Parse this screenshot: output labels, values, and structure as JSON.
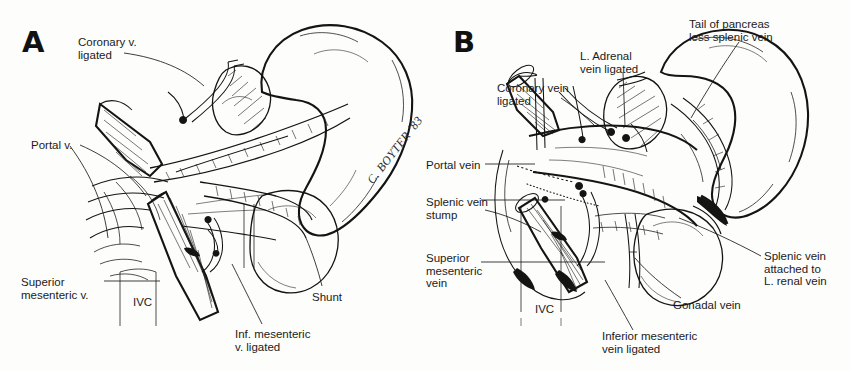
{
  "figure": {
    "background_color": "#fdfdfb",
    "ink_color": "#141414",
    "width": 850,
    "height": 371
  },
  "panel_a": {
    "letter": "A",
    "signature": "C. BOYTER '83",
    "labels": [
      {
        "id": "coronary-vein-ligated",
        "text": "Coronary v.\nligated",
        "x": 78,
        "y": 36,
        "align": "left"
      },
      {
        "id": "portal-vein",
        "text": "Portal v.",
        "x": 31,
        "y": 139,
        "align": "left"
      },
      {
        "id": "superior-mesenteric-vein",
        "text": "Superior\nmesenteric v.",
        "x": 21,
        "y": 276,
        "align": "left"
      },
      {
        "id": "ivc",
        "text": "IVC",
        "x": 133,
        "y": 296,
        "align": "left"
      },
      {
        "id": "shunt",
        "text": "Shunt",
        "x": 312,
        "y": 291,
        "align": "left"
      },
      {
        "id": "inferior-mesenteric-vein-ligated",
        "text": "Inf. mesenteric\nv. ligated",
        "x": 235,
        "y": 328,
        "align": "left"
      }
    ]
  },
  "panel_b": {
    "letter": "B",
    "labels": [
      {
        "id": "tail-of-pancreas",
        "text": "Tail of pancreas\nless splenic vein",
        "x": 264,
        "y": 18,
        "align": "left"
      },
      {
        "id": "l-adrenal-vein-ligated",
        "text": "L. Adrenal\nvein ligated",
        "x": 155,
        "y": 50,
        "align": "left"
      },
      {
        "id": "coronary-vein-ligated",
        "text": "Coronary vein\nligated",
        "x": 72,
        "y": 82,
        "align": "left"
      },
      {
        "id": "portal-vein",
        "text": "Portal vein",
        "x": 1,
        "y": 159,
        "align": "left"
      },
      {
        "id": "splenic-vein-stump",
        "text": "Splenic vein\nstump",
        "x": 1,
        "y": 196,
        "align": "left"
      },
      {
        "id": "superior-mesenteric-vein",
        "text": "Superior\nmesenteric\nvein",
        "x": 1,
        "y": 252,
        "align": "left"
      },
      {
        "id": "ivc",
        "text": "IVC",
        "x": 110,
        "y": 303,
        "align": "left"
      },
      {
        "id": "splenic-vein-attached-to-renal",
        "text": "Splenic vein\nattached to\nL. renal vein",
        "x": 339,
        "y": 250,
        "align": "left"
      },
      {
        "id": "gonadal-vein",
        "text": "Gonadal vein",
        "x": 248,
        "y": 299,
        "align": "left"
      },
      {
        "id": "inferior-mesenteric-vein-ligated",
        "text": "Inferior mesenteric\nvein ligated",
        "x": 177,
        "y": 330,
        "align": "left"
      }
    ]
  }
}
